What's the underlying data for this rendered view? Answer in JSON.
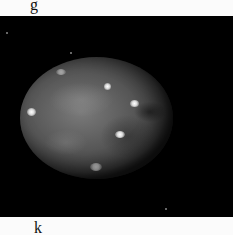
{
  "labels": {
    "top": "g",
    "bottom": "k"
  },
  "image": {
    "subject": "moon",
    "background_color": "#000000",
    "page_color": "#fbfbfb"
  }
}
